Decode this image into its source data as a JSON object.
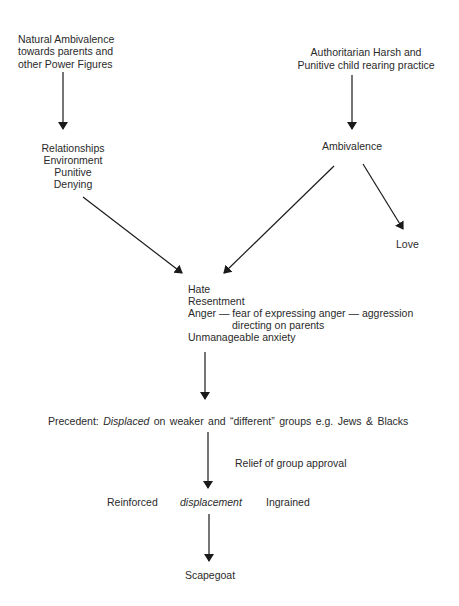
{
  "diagram": {
    "type": "flowchart",
    "nodes": {
      "natural_ambivalence": {
        "lines": [
          "Natural Ambivalence",
          "towards parents and",
          "other Power Figures"
        ]
      },
      "authoritarian": {
        "lines": [
          "Authoritarian Harsh and",
          "Punitive child rearing practice"
        ]
      },
      "relationships": {
        "lines": [
          "Relationships",
          "Environment",
          "Punitive",
          "Denying"
        ]
      },
      "ambivalence": {
        "label": "Ambivalence"
      },
      "love": {
        "label": "Love"
      },
      "hate_block": {
        "line1": "Hate",
        "line2": "Resentment",
        "line3": "Anger — fear of expressing anger — aggression",
        "line4": "directing on parents",
        "line5": "Unmanageable anxiety"
      },
      "precedent": {
        "prefix": "Precedent: ",
        "emphasis": "Displaced",
        "suffix": " on weaker and “different” groups e.g. Jews & Blacks"
      },
      "relief": {
        "label": "Relief of group approval"
      },
      "reinforced": {
        "left": "Reinforced",
        "middle": "displacement",
        "right": "Ingrained"
      },
      "scapegoat": {
        "label": "Scapegoat"
      }
    },
    "edges": [
      {
        "from": "natural_ambivalence",
        "to": "relationships"
      },
      {
        "from": "authoritarian",
        "to": "ambivalence"
      },
      {
        "from": "relationships",
        "to": "hate_block"
      },
      {
        "from": "ambivalence",
        "to": "hate_block"
      },
      {
        "from": "ambivalence",
        "to": "love"
      },
      {
        "from": "hate_block",
        "to": "precedent"
      },
      {
        "from": "precedent",
        "to": "reinforced",
        "label": "Relief of group approval"
      },
      {
        "from": "reinforced",
        "to": "scapegoat"
      }
    ],
    "colors": {
      "text": "#2a2a2a",
      "line": "#1a1a1a",
      "background": "#ffffff"
    }
  }
}
